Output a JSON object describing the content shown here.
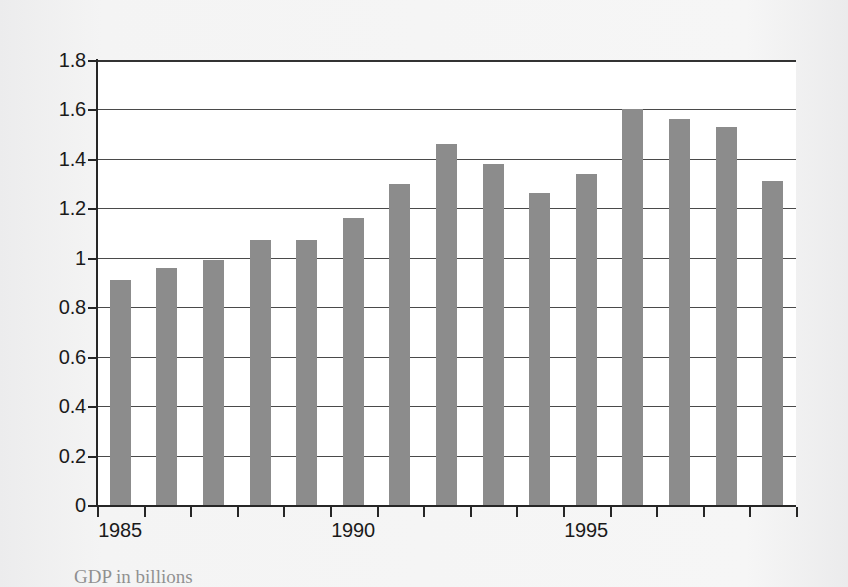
{
  "chart_data": {
    "type": "bar",
    "title": "",
    "subtitle": "",
    "xlabel": "",
    "ylabel": "",
    "categories": [
      "1985",
      "1986",
      "1987",
      "1988",
      "1989",
      "1990",
      "1991",
      "1992",
      "1993",
      "1994",
      "1995",
      "1996",
      "1997",
      "1998",
      "1999"
    ],
    "values": [
      0.91,
      0.96,
      0.99,
      1.07,
      1.07,
      1.16,
      1.3,
      1.46,
      1.38,
      1.26,
      1.34,
      1.6,
      1.56,
      1.53,
      1.31
    ],
    "series": [
      {
        "name": "",
        "values": [
          0.91,
          0.96,
          0.99,
          1.07,
          1.07,
          1.16,
          1.3,
          1.46,
          1.38,
          1.26,
          1.34,
          1.6,
          1.56,
          1.53,
          1.31
        ]
      }
    ],
    "ylim": [
      0,
      1.8
    ],
    "ytick_labels": [
      "0",
      "0.2",
      "0.4",
      "0.6",
      "0.8",
      "1",
      "1.2",
      "1.4",
      "1.6",
      "1.8"
    ],
    "ytick_values": [
      0,
      0.2,
      0.4,
      0.6,
      0.8,
      1.0,
      1.2,
      1.4,
      1.6,
      1.8
    ],
    "xtick_labels": [
      "1985",
      "1990",
      "1995"
    ],
    "xtick_categories": [
      "1985",
      "1990",
      "1995"
    ],
    "grid": "horizontal",
    "legend": "none",
    "bar_color": "#8c8c8c",
    "axis_color": "#262626",
    "gridline_color": "#4a4a4a",
    "plot_background": "#ffffff",
    "page_background": "#f2f2f2"
  },
  "caption": {
    "text": "GDP                                              in billions"
  }
}
